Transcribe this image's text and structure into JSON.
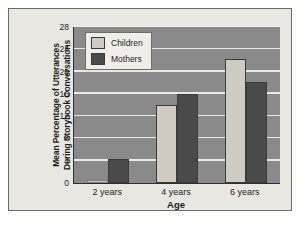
{
  "chart_data": {
    "type": "bar",
    "title": "",
    "xlabel": "Age",
    "ylabel": "Mean Percentage of Utterances During Storybook Conversations",
    "ylabel_lines": [
      "Mean Percentage of Utterances",
      "During Storybook Conversations"
    ],
    "categories": [
      "2 years",
      "4 years",
      "6 years"
    ],
    "series": [
      {
        "name": "Children",
        "values": [
          0.5,
          14.0,
          22.3
        ],
        "color": "#cfcbc0"
      },
      {
        "name": "Mothers",
        "values": [
          4.3,
          16.0,
          18.2
        ],
        "color": "#4a4a4a"
      }
    ],
    "ylim": [
      0,
      28
    ],
    "yticks": [
      0,
      4,
      8,
      12,
      16,
      20,
      24,
      28
    ],
    "ytick_labels": [
      "0",
      "4",
      "8",
      "12",
      "16",
      "20",
      "24",
      "28"
    ],
    "grid": true,
    "grid_color": "#f2f1ec",
    "legend_position": "upper left",
    "plot_background": "#8a8a8a",
    "figure_background": "#e9e7e2",
    "page_background": "#ffffff",
    "axis_color": "#2e2e2e"
  }
}
